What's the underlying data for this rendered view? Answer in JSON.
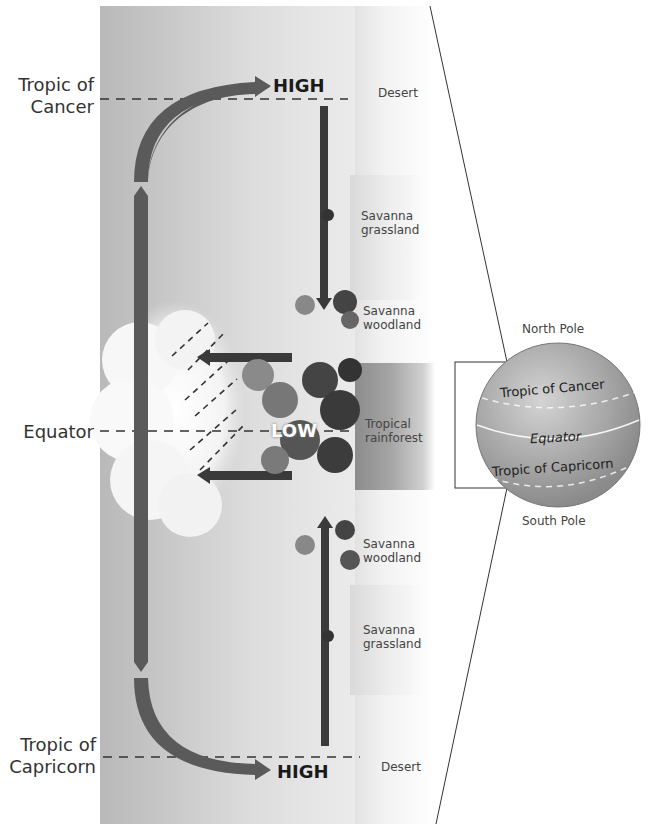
{
  "diagram": {
    "latitudes": {
      "tropic_of_cancer": {
        "line1": "Tropic of",
        "line2": "Cancer"
      },
      "equator": "Equator",
      "tropic_of_capricorn": {
        "line1": "Tropic of",
        "line2": "Capricorn"
      }
    },
    "pressure": {
      "high_north": "HIGH",
      "low": "LOW",
      "high_south": "HIGH"
    },
    "biomes": {
      "desert_north": "Desert",
      "savanna_grassland_north": {
        "line1": "Savanna",
        "line2": "grassland"
      },
      "savanna_woodland_north": {
        "line1": "Savanna",
        "line2": "woodland"
      },
      "tropical_rainforest": {
        "line1": "Tropical",
        "line2": "rainforest"
      },
      "savanna_woodland_south": {
        "line1": "Savanna",
        "line2": "woodland"
      },
      "savanna_grassland_south": {
        "line1": "Savanna",
        "line2": "grassland"
      },
      "desert_south": "Desert"
    },
    "globe": {
      "north_pole": "North Pole",
      "tropic_of_cancer": "Tropic of Cancer",
      "equator": "Equator",
      "tropic_of_capricorn": "Tropic of Capricorn",
      "south_pole": "South Pole"
    },
    "colors": {
      "arrow_dark": "#3a3a3a",
      "arrow_circulation": "#5a5a5a",
      "panel_light": "#e6e6e6",
      "panel_dark": "#b9b9b9",
      "globe": "#9a9a9a"
    }
  }
}
